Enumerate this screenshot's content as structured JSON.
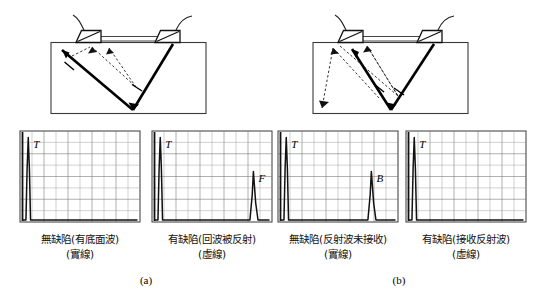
{
  "figure": {
    "subfigures": [
      {
        "id": "a",
        "label": "(a)"
      },
      {
        "id": "b",
        "label": "(b)"
      }
    ]
  },
  "captions": [
    {
      "line1": "無缺陷(有底面波)",
      "line2": "(實線)"
    },
    {
      "line1": "有缺陷(回波被反射)",
      "line2": "(虛線)"
    },
    {
      "line1": "無缺陷(反射波未接收)",
      "line2": "(實線)"
    },
    {
      "line1": "有缺陷(接收反射波)",
      "line2": "(虛線)"
    }
  ],
  "scan_panels": [
    {
      "name": "panel-a-left",
      "peaks": [
        {
          "label": "T",
          "position_pct": 5,
          "height_pct": 97
        }
      ],
      "grid_cols": 10,
      "grid_rows": 8
    },
    {
      "name": "panel-a-right",
      "peaks": [
        {
          "label": "T",
          "position_pct": 5,
          "height_pct": 97
        },
        {
          "label": "F",
          "position_pct": 86,
          "height_pct": 57
        }
      ],
      "grid_cols": 10,
      "grid_rows": 8
    },
    {
      "name": "panel-b-left",
      "peaks": [
        {
          "label": "T",
          "position_pct": 5,
          "height_pct": 97
        },
        {
          "label": "B",
          "position_pct": 79,
          "height_pct": 57
        }
      ],
      "grid_cols": 10,
      "grid_rows": 8
    },
    {
      "name": "panel-b-right",
      "peaks": [
        {
          "label": "T",
          "position_pct": 5,
          "height_pct": 97
        }
      ],
      "grid_cols": 10,
      "grid_rows": 8
    }
  ],
  "chart_data": {
    "type": "line",
    "xlabel": "",
    "ylabel": "",
    "charts": [
      {
        "name": "panel-a-left",
        "caption_line1": "無缺陷(有底面波)",
        "caption_line2": "(實線)",
        "peak_labels": [
          "T"
        ],
        "x": [
          0,
          3,
          4,
          5,
          6,
          7,
          100
        ],
        "y": [
          0,
          0,
          60,
          97,
          60,
          0,
          0
        ],
        "xlim": [
          0,
          100
        ],
        "ylim": [
          0,
          100
        ],
        "grid": true
      },
      {
        "name": "panel-a-right",
        "caption_line1": "有缺陷(回波被反射)",
        "caption_line2": "(虛線)",
        "peak_labels": [
          "T",
          "F"
        ],
        "x": [
          0,
          3,
          4,
          5,
          6,
          7,
          83,
          85,
          86,
          88,
          90,
          100
        ],
        "y": [
          0,
          0,
          60,
          97,
          60,
          0,
          0,
          30,
          57,
          20,
          0,
          0
        ],
        "xlim": [
          0,
          100
        ],
        "ylim": [
          0,
          100
        ],
        "grid": true
      },
      {
        "name": "panel-b-left",
        "caption_line1": "無缺陷(反射波未接收)",
        "caption_line2": "(實線)",
        "peak_labels": [
          "T",
          "B"
        ],
        "x": [
          0,
          3,
          4,
          5,
          6,
          7,
          76,
          78,
          79,
          81,
          83,
          100
        ],
        "y": [
          0,
          0,
          60,
          97,
          60,
          0,
          0,
          30,
          57,
          20,
          0,
          0
        ],
        "xlim": [
          0,
          100
        ],
        "ylim": [
          0,
          100
        ],
        "grid": true
      },
      {
        "name": "panel-b-right",
        "caption_line1": "有缺陷(接收反射波)",
        "caption_line2": "(虛線)",
        "peak_labels": [
          "T"
        ],
        "x": [
          0,
          3,
          4,
          5,
          6,
          7,
          100
        ],
        "y": [
          0,
          0,
          60,
          97,
          60,
          0,
          0
        ],
        "xlim": [
          0,
          100
        ],
        "ylim": [
          0,
          100
        ],
        "grid": true
      }
    ]
  },
  "colors": {
    "ink": "#000000",
    "grid": "#6f6f6f",
    "frame": "#4a4a4a",
    "paper": "#ffffff"
  }
}
